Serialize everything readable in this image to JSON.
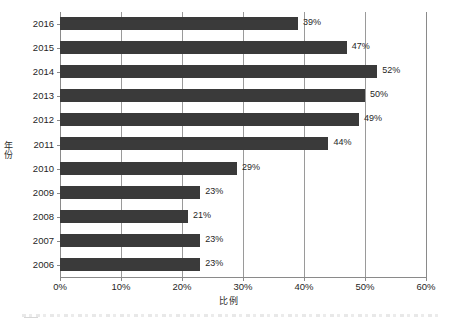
{
  "chart_data": {
    "type": "bar",
    "orientation": "horizontal",
    "title": "",
    "xlabel": "比例",
    "ylabel": "年份",
    "xlim": [
      0,
      60
    ],
    "xtick_labels": [
      "0%",
      "10%",
      "20%",
      "30%",
      "40%",
      "50%",
      "60%"
    ],
    "xtick_values": [
      0,
      10,
      20,
      30,
      40,
      50,
      60
    ],
    "grid": true,
    "legend": false,
    "categories": [
      "2016",
      "2015",
      "2014",
      "2013",
      "2012",
      "2011",
      "2010",
      "2009",
      "2008",
      "2007",
      "2006"
    ],
    "values": [
      39,
      47,
      52,
      50,
      49,
      44,
      29,
      23,
      21,
      23,
      23
    ],
    "data_labels": [
      "39%",
      "47%",
      "52%",
      "50%",
      "49%",
      "44%",
      "29%",
      "23%",
      "21%",
      "23%",
      "23%"
    ],
    "bar_color": "#3a3a3a",
    "gridline_color": "#9a9a9a",
    "background_color": "#ffffff"
  },
  "axes": {
    "y_title": "年份",
    "x_title": "比例"
  }
}
